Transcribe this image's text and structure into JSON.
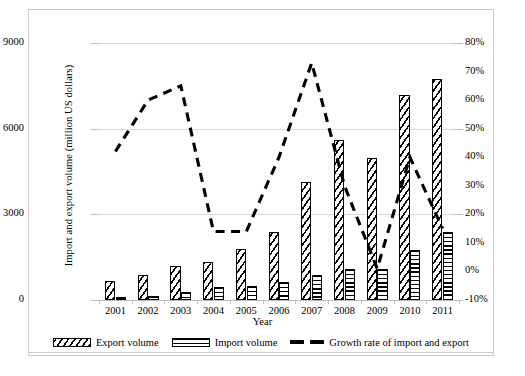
{
  "chart_data": {
    "type": "bar",
    "title": "",
    "subtitle": "",
    "xlabel": "Year",
    "ylabel": "Import and export volume (million US dollars)",
    "y2label": "Growth rate of import and export",
    "categories": [
      "2001",
      "2002",
      "2003",
      "2004",
      "2005",
      "2006",
      "2007",
      "2008",
      "2009",
      "2010",
      "2011"
    ],
    "ylim": [
      0,
      9000
    ],
    "yticks": [
      0,
      3000,
      6000,
      9000
    ],
    "ytick_labels": [
      "0",
      "3000",
      "6000",
      "9000"
    ],
    "y2lim": [
      -10,
      80
    ],
    "y2ticks": [
      -10,
      0,
      10,
      20,
      30,
      40,
      50,
      60,
      70,
      80
    ],
    "y2tick_labels": [
      "-10%",
      "0%",
      "10%",
      "20%",
      "30%",
      "40%",
      "50%",
      "60%",
      "70%",
      "80%"
    ],
    "grid": true,
    "legend_position": "bottom",
    "series": [
      {
        "name": "Export volume",
        "type": "bar",
        "axis": "left",
        "pattern": "diagonal-hatch",
        "values": [
          680,
          860,
          1180,
          1330,
          1790,
          2370,
          4140,
          5620,
          4970,
          7170,
          7740
        ]
      },
      {
        "name": "Import volume",
        "type": "bar",
        "axis": "left",
        "pattern": "horizontal-hatch",
        "values": [
          90,
          130,
          290,
          460,
          480,
          630,
          870,
          1070,
          1100,
          1760,
          2370
        ]
      },
      {
        "name": "Growth rate of import and export",
        "type": "line",
        "axis": "right",
        "style": "dashed",
        "values": [
          42,
          60,
          65,
          14,
          14,
          40,
          73,
          30,
          1,
          40,
          15
        ]
      }
    ]
  },
  "legend": {
    "items": [
      {
        "label": "Export volume",
        "swatch": "diagonal-hatch"
      },
      {
        "label": "Import volume",
        "swatch": "horizontal-hatch"
      },
      {
        "label": "Growth rate of import and export",
        "swatch": "dashed-line"
      }
    ]
  }
}
